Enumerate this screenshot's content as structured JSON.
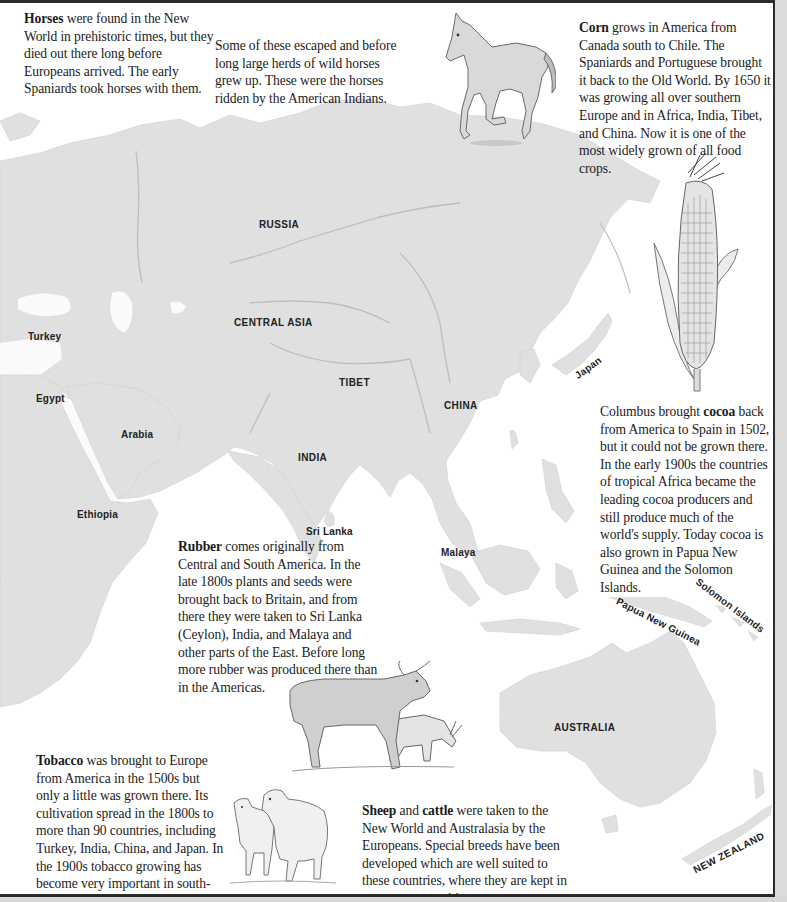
{
  "map": {
    "labels": {
      "russia": "RUSSIA",
      "central_asia": "CENTRAL ASIA",
      "tibet": "TIBET",
      "china": "CHINA",
      "india": "INDIA",
      "japan": "Japan",
      "turkey": "Turkey",
      "egypt": "Egypt",
      "arabia": "Arabia",
      "ethiopia": "Ethiopia",
      "sri_lanka": "Sri Lanka",
      "malaya": "Malaya",
      "papua_new_guinea": "Papua New Guinea",
      "solomon_islands": "Solomon Islands",
      "australia": "AUSTRALIA",
      "new_zealand": "NEW ZEALAND"
    },
    "colors": {
      "land": "#e3e3e3",
      "land_relief": "#c4c4c4",
      "sea": "#ffffff",
      "text": "#1b1b1b"
    }
  },
  "texts": {
    "horses": {
      "bold": "Horses",
      "rest": " were found in the New World in prehistoric times, but they died out there long before Europeans arrived. The early Spaniards took horses with them."
    },
    "horses_cont": {
      "rest": "Some of these escaped and before long large herds of wild horses grew up. These were the horses ridden by the American Indians."
    },
    "corn": {
      "bold": "Corn",
      "rest": " grows in America from Canada south to Chile. The Spaniards and Portuguese brought it back to the Old World. By 1650 it was growing all over southern Europe and in Africa, India, Tibet, and China. Now it is one of the most widely grown of all food crops."
    },
    "cocoa": {
      "pre": "Columbus brought ",
      "bold": "cocoa",
      "rest": " back from America to Spain in 1502, but it could not be grown there. In the early 1900s the countries of tropical Africa became the leading cocoa producers and still produce much of the world's supply. Today cocoa is also grown in Papua New Guinea and the Solomon Islands."
    },
    "rubber": {
      "bold": "Rubber",
      "rest": " comes originally from Central and South America. In the late 1800s plants and seeds were brought back to Britain, and from there they were taken to Sri Lanka (Ceylon), India, and Malaya and other parts of the East. Before long more rubber was produced there than in the Americas."
    },
    "tobacco": {
      "bold": "Tobacco",
      "rest": " was brought to Europe from America in the 1500s but only a little was grown there. Its cultivation spread in the 1800s to more than 90 countries, including Turkey, India, China, and Japan. In the 1900s tobacco growing has become very important in south-central Africa."
    },
    "sheep": {
      "bold1": "Sheep",
      "mid": " and ",
      "bold2": "cattle",
      "rest": " were taken to the New World and Australasia by the Europeans. Special breeds have been developed which are well suited to these countries, where they are kept in enormous quantities."
    }
  },
  "illustrations": {
    "horse": "horse-illustration",
    "corn": "corn-cob-illustration",
    "cattle": "cattle-illustration",
    "sheep": "sheep-illustration"
  }
}
